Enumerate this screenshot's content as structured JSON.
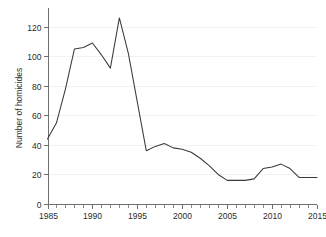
{
  "chart_data": {
    "type": "line",
    "title": "",
    "subtitle": "",
    "xlabel": "",
    "ylabel": "Number of homicides",
    "xlim": [
      1985,
      2015
    ],
    "ylim": [
      0,
      130
    ],
    "grid": "horizontal",
    "legend": "none",
    "x_ticks": [
      1985,
      1990,
      1995,
      2000,
      2005,
      2010,
      2015
    ],
    "x_tick_labels": [
      "1985",
      "1990",
      "1995",
      "2000",
      "2005",
      "2010",
      "2015"
    ],
    "x_minor_tick_step": 1,
    "y_ticks": [
      0,
      20,
      40,
      60,
      80,
      100,
      120
    ],
    "y_tick_labels": [
      "0",
      "20",
      "40",
      "60",
      "80",
      "100",
      "120"
    ],
    "x": [
      1985,
      1986,
      1987,
      1988,
      1989,
      1990,
      1991,
      1992,
      1993,
      1994,
      1995,
      1996,
      1997,
      1998,
      1999,
      2000,
      2001,
      2002,
      2003,
      2004,
      2005,
      2006,
      2007,
      2008,
      2009,
      2010,
      2011,
      2012,
      2013,
      2014,
      2015
    ],
    "series": [
      {
        "name": "Number of homicides",
        "color": "#3a3a3a",
        "values": [
          44,
          55,
          78,
          105,
          106,
          109,
          101,
          92,
          126,
          102,
          69,
          36,
          39,
          41,
          38,
          37,
          35,
          31,
          26,
          20,
          16,
          16,
          16,
          17,
          24,
          25,
          27,
          24,
          18,
          18,
          18
        ]
      }
    ],
    "annotations": []
  },
  "colors": {
    "background": "#ffffff",
    "axis": "#6f6f6f",
    "grid": "#f2f2f2",
    "text": "#2b2b2b",
    "line": "#3a3a3a"
  }
}
